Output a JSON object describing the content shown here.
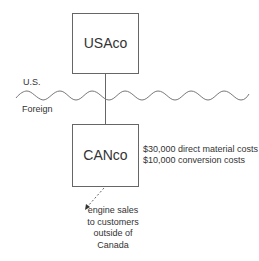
{
  "diagram": {
    "top_entity": {
      "label": "USAco"
    },
    "bottom_entity": {
      "label": "CANco"
    },
    "border": {
      "upper_label": "U.S.",
      "lower_label": "Foreign"
    },
    "costs": [
      "$30,000 direct material costs",
      "$10,000 conversion costs"
    ],
    "sales_note": [
      "engine sales",
      "to customers",
      "outside of",
      "Canada"
    ],
    "colors": {
      "line": "#555555",
      "text": "#333333",
      "background": "#ffffff"
    }
  }
}
